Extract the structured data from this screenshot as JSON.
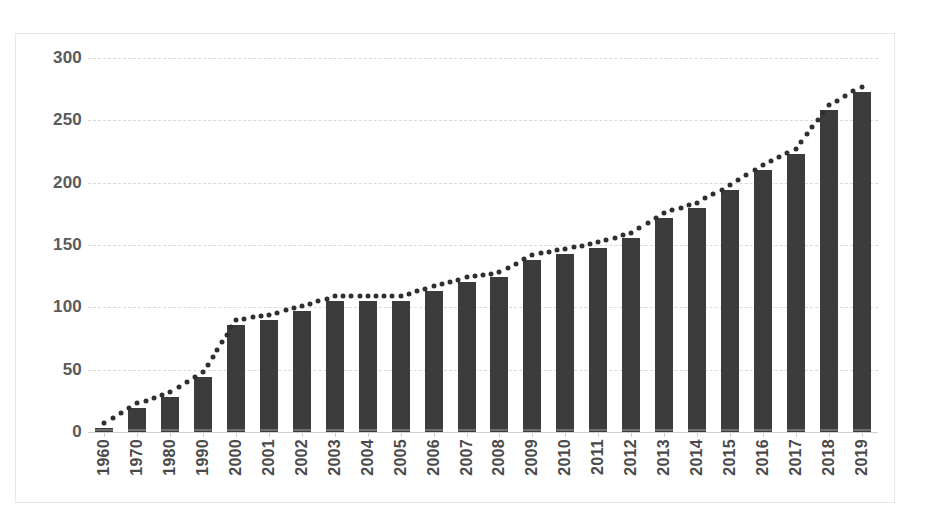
{
  "chart_data": {
    "type": "bar",
    "title": "",
    "subtitle": "",
    "xlabel": "",
    "ylabel": "",
    "ylim": [
      0,
      300
    ],
    "ytick_values": [
      300,
      250,
      200,
      150,
      100,
      50,
      0
    ],
    "ytick_labels": [
      "300",
      "250",
      "200",
      "150",
      "100",
      "50",
      "0"
    ],
    "grid": true,
    "grid_style": "dashed",
    "legend": false,
    "legend_position": "none",
    "bar_color": "#3c3c3c",
    "trendline": {
      "style": "dotted",
      "color": "#2f2f2f",
      "follows": "bar-tops"
    },
    "categories": [
      "1960",
      "1970",
      "1980",
      "1990",
      "2000",
      "2001",
      "2002",
      "2003",
      "2004",
      "2005",
      "2006",
      "2007",
      "2008",
      "2009",
      "2010",
      "2011",
      "2012",
      "2013",
      "2014",
      "2015",
      "2016",
      "2017",
      "2018",
      "2019"
    ],
    "values": [
      3,
      19,
      28,
      44,
      86,
      90,
      97,
      105,
      105,
      105,
      113,
      120,
      124,
      138,
      143,
      148,
      156,
      172,
      180,
      194,
      210,
      223,
      258,
      273
    ],
    "series": [
      {
        "name": "",
        "values": [
          3,
          19,
          28,
          44,
          86,
          90,
          97,
          105,
          105,
          105,
          113,
          120,
          124,
          138,
          143,
          148,
          156,
          172,
          180,
          194,
          210,
          223,
          258,
          273
        ]
      }
    ]
  },
  "colors": {
    "background": "#ffffff",
    "bar": "#3c3c3c",
    "gridline": "#d9d9d9",
    "axis_text": "#5a5a5a",
    "frame": "#e8e8e8"
  }
}
